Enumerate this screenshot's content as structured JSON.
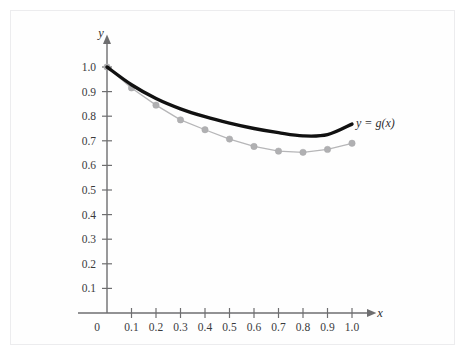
{
  "figure": {
    "background_color": "#ffffff",
    "frame_color": "#ececee",
    "axis_color": "#6e6e70",
    "origin_label": "0",
    "x_axis_name": "x",
    "y_axis_name": "y",
    "curve_label": "y = g(x)"
  },
  "chart_data": {
    "type": "line",
    "title": "",
    "subtitle": "",
    "xlabel": "x",
    "ylabel": "y",
    "xlim": [
      0,
      1.0
    ],
    "ylim": [
      0,
      1.0
    ],
    "grid": false,
    "legend_position": "inline-right",
    "x_ticks": [
      "0",
      "0.1",
      "0.2",
      "0.3",
      "0.4",
      "0.5",
      "0.6",
      "0.7",
      "0.8",
      "0.9",
      "1.0"
    ],
    "x_tick_values": [
      0,
      0.1,
      0.2,
      0.3,
      0.4,
      0.5,
      0.6,
      0.7,
      0.8,
      0.9,
      1.0
    ],
    "y_ticks": [
      "0",
      "0.1",
      "0.2",
      "0.3",
      "0.4",
      "0.5",
      "0.6",
      "0.7",
      "0.8",
      "0.9",
      "1.0"
    ],
    "y_tick_values": [
      0,
      0.1,
      0.2,
      0.3,
      0.4,
      0.5,
      0.6,
      0.7,
      0.8,
      0.9,
      1.0
    ],
    "x": [
      0,
      0.1,
      0.2,
      0.3,
      0.4,
      0.5,
      0.6,
      0.7,
      0.8,
      0.9,
      1.0
    ],
    "series": [
      {
        "name": "y = g(x)",
        "style": "smooth-curve",
        "color": "#111111",
        "width": 3.4,
        "markers": false,
        "values": [
          1.0,
          0.928,
          0.872,
          0.83,
          0.798,
          0.772,
          0.75,
          0.733,
          0.72,
          0.725,
          0.768
        ]
      },
      {
        "name": "sampled-points",
        "style": "polyline-with-markers",
        "color": "#b6b6b8",
        "width": 1.3,
        "markers": true,
        "marker_color": "#b0b0b2",
        "marker_radius": 3.2,
        "values": [
          1.0,
          0.915,
          0.845,
          0.785,
          0.745,
          0.707,
          0.677,
          0.658,
          0.653,
          0.665,
          0.69
        ]
      }
    ],
    "annotations": [
      {
        "text": "y = g(x)",
        "x": 1.0,
        "y": 0.79
      }
    ]
  }
}
